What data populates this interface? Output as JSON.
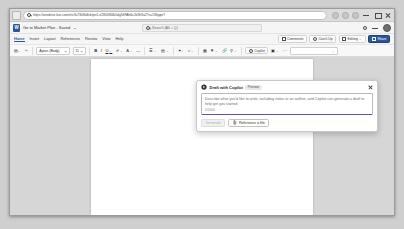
{
  "browser": {
    "name": "Microsoft Edge",
    "url": "https://onedrive.live.com/e/c/fa730f4dfcb/pe/Ls/2805f84b5dg56FAh6c2b3h3a2?e=CMgqnY",
    "tab_switcher_icon": "tab-list-icon",
    "search_icon": "search-icon",
    "favorite_icon": "favorite-star-icon",
    "extensions_icon": "extensions-icon",
    "profile_icon": "profile-avatar-icon",
    "minimize_label": "minimize-icon",
    "restore_label": "restore-icon",
    "close_label": "close-icon"
  },
  "word": {
    "logo": "word-logo-icon",
    "doc_title": "Go to Market Plan - Saved",
    "doc_title_caret": "⌄",
    "search": {
      "placeholder": "Search (Alt + Q)",
      "icon": "search-icon"
    },
    "settings_icon": "gear-icon",
    "minimize_icon": "minimize-icon",
    "avatar": "user-avatar",
    "ribbon_tabs": [
      {
        "label": "Home",
        "active": true
      },
      {
        "label": "Insert",
        "active": false
      },
      {
        "label": "Layout",
        "active": false
      },
      {
        "label": "References",
        "active": false
      },
      {
        "label": "Review",
        "active": false
      },
      {
        "label": "View",
        "active": false
      },
      {
        "label": "Help",
        "active": false
      }
    ],
    "ribbon_actions": [
      {
        "label": "Comments",
        "icon": "comment-icon",
        "style": "default"
      },
      {
        "label": "Catch Up",
        "icon": "catchup-icon",
        "style": "default"
      },
      {
        "label": "Editing",
        "icon": "pencil-icon",
        "style": "default"
      },
      {
        "label": "Share",
        "icon": "share-icon",
        "style": "primary"
      }
    ],
    "toolbar": {
      "paste_icon": "paste-icon",
      "format_painter_icon": "format-painter-icon",
      "font_name": "Aptos (Body)",
      "font_size": "11",
      "bold": "B",
      "italic": "I",
      "underline": "U",
      "highlight_icon": "highlight-color-icon",
      "font_color_icon": "font-color-icon",
      "strikethrough_icon": "strikethrough-icon",
      "bullets_icon": "bullet-list-icon",
      "align_icon": "align-icon",
      "styles_icon": "text-styles-icon",
      "find_icon": "find-icon",
      "table_icon": "insert-table-icon",
      "picture_icon": "insert-picture-icon",
      "link_icon": "insert-link-icon",
      "dictate_icon": "dictate-icon",
      "copilot_label": "Copilot",
      "copilot_icon": "copilot-icon",
      "editor_icon": "editor-icon",
      "overflow": "···",
      "style_gallery_caret": "⌄"
    }
  },
  "copilot_dialog": {
    "icon": "copilot-icon",
    "title": "Draft with Copilot",
    "badge": "Preview",
    "close_icon": "close-icon",
    "placeholder": "Describe what you'd like to write, including notes or an outline, and Copilot can generate a draft to help get you started",
    "counter": "0/2000",
    "generate_button": "Generate",
    "reference_button": "Reference a file",
    "reference_icon": "attach-file-icon"
  },
  "colors": {
    "word_blue": "#2b579a",
    "copilot_purple": "#6b4fa8",
    "canvas_gray": "#d6d6d6",
    "page_white": "#ffffff"
  }
}
